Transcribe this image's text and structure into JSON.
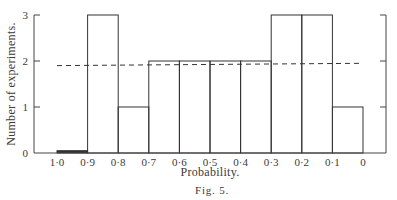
{
  "chart_data": {
    "type": "bar",
    "title": "",
    "caption": "Fig. 5.",
    "xlabel": "Probability.",
    "ylabel": "Number of experiments.",
    "x_tick_labels": [
      "1·0",
      "0·9",
      "0·8",
      "0·7",
      "0·6",
      "0·5",
      "0·4",
      "0·3",
      "0·2",
      "0·1",
      "0"
    ],
    "y_tick_labels": [
      "0",
      "1",
      "2",
      "3"
    ],
    "categories": [
      "1·0–0·9",
      "0·9–0·8",
      "0·8–0·7",
      "0·7–0·6",
      "0·6–0·5",
      "0·5–0·4",
      "0·4–0·3",
      "0·3–0·2",
      "0·2–0·1",
      "0·1–0"
    ],
    "values": [
      0.05,
      3,
      1,
      2,
      2,
      2,
      2,
      3,
      3,
      1
    ],
    "reference_line": {
      "style": "dashed",
      "y_start": 1.9,
      "y_end": 1.95,
      "x_from": "1·0",
      "x_to": "0"
    },
    "ylim": [
      0,
      3
    ],
    "xaxis_reversed": true,
    "grid": false,
    "legend": null
  }
}
